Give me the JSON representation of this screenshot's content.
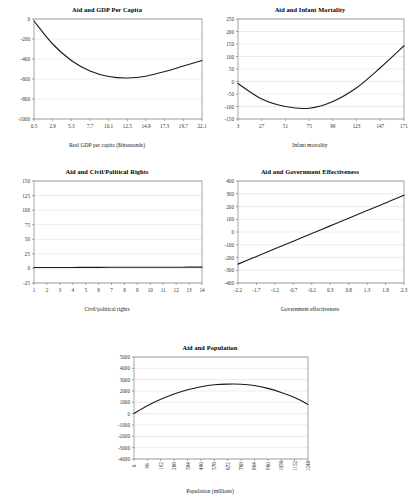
{
  "page": {
    "background": "#ffffff",
    "line_color": "#1a1a1a",
    "grid_color": "#d9d9d9",
    "axis_color": "#7f7f7f"
  },
  "chart_data": [
    {
      "id": "aid-gdp-per-capita",
      "type": "line",
      "title": "Aid and GDP Per Capita",
      "xlabel": "Real GDP per capita ($thousands)",
      "ylabel": "",
      "grid": true,
      "legend": "none",
      "xticks": [
        "0.5",
        "2.9",
        "5.3",
        "7.7",
        "10.1",
        "12.5",
        "14.9",
        "17.3",
        "19.7",
        "22.1"
      ],
      "yticks": [
        "0",
        "-200",
        "-400",
        "-600",
        "-800",
        "-1000"
      ],
      "xlim": [
        0.5,
        22.1
      ],
      "ylim": [
        -1000,
        0
      ],
      "x": [
        0.5,
        2.9,
        5.3,
        7.7,
        10.1,
        12.5,
        14.9,
        17.3,
        19.7,
        22.1
      ],
      "values": [
        -20,
        -250,
        -415,
        -520,
        -575,
        -590,
        -572,
        -525,
        -470,
        -415
      ]
    },
    {
      "id": "aid-infant-mortality",
      "type": "line",
      "title": "Aid and Infant Mortality",
      "xlabel": "Infant mortality",
      "ylabel": "",
      "grid": true,
      "legend": "none",
      "xticks": [
        "3",
        "27",
        "51",
        "75",
        "99",
        "123",
        "147",
        "171"
      ],
      "yticks": [
        "250",
        "200",
        "150",
        "100",
        "50",
        "0",
        "-50",
        "-100",
        "-150"
      ],
      "xlim": [
        3,
        171
      ],
      "ylim": [
        -150,
        250
      ],
      "x": [
        3,
        27,
        51,
        75,
        99,
        123,
        147,
        171
      ],
      "values": [
        -8,
        -70,
        -100,
        -107,
        -80,
        -25,
        55,
        143
      ]
    },
    {
      "id": "aid-civil-political-rights",
      "type": "line",
      "title": "Aid and Civil/Political Rights",
      "xlabel": "Civil/political rights",
      "ylabel": "",
      "grid": true,
      "legend": "none",
      "xticks": [
        "1",
        "2",
        "3",
        "4",
        "5",
        "6",
        "7",
        "8",
        "9",
        "10",
        "11",
        "12",
        "13",
        "14"
      ],
      "yticks": [
        "150",
        "125",
        "100",
        "75",
        "50",
        "25",
        "0",
        "-25"
      ],
      "xlim": [
        1,
        14
      ],
      "ylim": [
        -25,
        150
      ],
      "x": [
        1,
        2,
        3,
        4,
        5,
        6,
        7,
        8,
        9,
        10,
        11,
        12,
        13,
        14
      ],
      "values": [
        1.5,
        1.6,
        1.7,
        1.7,
        1.8,
        1.8,
        1.9,
        1.9,
        2.0,
        2.0,
        2.1,
        2.1,
        2.2,
        2.2
      ]
    },
    {
      "id": "aid-government-effectiveness",
      "type": "line",
      "title": "Aid and Government Effectiveness",
      "xlabel": "Government effectiveness",
      "ylabel": "",
      "grid": true,
      "legend": "none",
      "xticks": [
        "-2.2",
        "-1.7",
        "-1.2",
        "-0.7",
        "-0.2",
        "0.3",
        "0.8",
        "1.3",
        "1.8",
        "2.3"
      ],
      "yticks": [
        "400",
        "300",
        "200",
        "100",
        "0",
        "-100",
        "-200",
        "-300",
        "-400"
      ],
      "xlim": [
        -2.2,
        2.3
      ],
      "ylim": [
        -400,
        400
      ],
      "x": [
        -2.2,
        -1.7,
        -1.2,
        -0.7,
        -0.2,
        0.3,
        0.8,
        1.3,
        1.8,
        2.3
      ],
      "values": [
        -252,
        -192,
        -132,
        -72,
        -12,
        48,
        108,
        168,
        228,
        288
      ]
    },
    {
      "id": "aid-population",
      "type": "line",
      "title": "Aid and Population",
      "xlabel": "Population (millions)",
      "ylabel": "",
      "grid": true,
      "legend": "none",
      "xticks": [
        "0",
        "96",
        "192",
        "288",
        "384",
        "480",
        "576",
        "672",
        "768",
        "864",
        "960",
        "1056",
        "1152",
        "1248"
      ],
      "yticks": [
        "5000",
        "4000",
        "3000",
        "2000",
        "1000",
        "0",
        "-1000",
        "-2000",
        "-3000",
        "-4000"
      ],
      "xlim": [
        0,
        1248
      ],
      "ylim": [
        -4000,
        5000
      ],
      "x": [
        0,
        96,
        192,
        288,
        384,
        480,
        576,
        672,
        768,
        864,
        960,
        1056,
        1152,
        1248
      ],
      "values": [
        30,
        700,
        1270,
        1740,
        2110,
        2380,
        2550,
        2610,
        2600,
        2480,
        2230,
        1870,
        1420,
        820
      ]
    }
  ]
}
